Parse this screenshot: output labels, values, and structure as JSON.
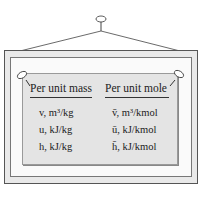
{
  "sign": {
    "columns": [
      {
        "header": "Per unit mass",
        "rows": [
          "v, m³/kg",
          "u, kJ/kg",
          "h, kJ/kg"
        ]
      },
      {
        "header": "Per unit mole",
        "rows": [
          "v̄, m³/kmol",
          "ū, kJ/kmol",
          "h̄, kJ/kmol"
        ]
      }
    ]
  }
}
